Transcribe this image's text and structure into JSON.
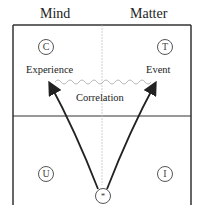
{
  "headers": {
    "left": "Mind",
    "right": "Matter"
  },
  "quadrants": {
    "top_left": "C",
    "top_right": "T",
    "bottom_left": "U",
    "bottom_right": "I"
  },
  "labels": {
    "experience": "Experience",
    "event": "Event",
    "correlation": "Correlation"
  },
  "origin_symbol": "*"
}
